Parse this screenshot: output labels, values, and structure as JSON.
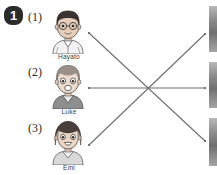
{
  "worksheet": {
    "question_number": "1",
    "items": [
      {
        "number": "(1)",
        "name": "Hayato",
        "portrait": "boy-with-glasses-portrait",
        "hair_color": "#3a3330",
        "skin_color": "#e7cdb8"
      },
      {
        "number": "(2)",
        "name": "Luke",
        "portrait": "boy-light-hair-portrait",
        "hair_color": "#9b9088",
        "skin_color": "#eddacb"
      },
      {
        "number": "(3)",
        "name": "Emi",
        "portrait": "girl-bob-hair-portrait",
        "hair_color": "#4a403b",
        "skin_color": "#ecd5c2"
      }
    ],
    "connector_lines": [
      {
        "name": "line-from-item-1",
        "x1": 89,
        "y1": 33,
        "x2": 205,
        "y2": 141
      },
      {
        "name": "line-from-item-2",
        "x1": 89,
        "y1": 88,
        "x2": 205,
        "y2": 88
      },
      {
        "name": "line-from-item-3",
        "x1": 89,
        "y1": 145,
        "x2": 205,
        "y2": 34
      }
    ],
    "line_color": "#6e6e6e",
    "answer_thumbnails": [
      {
        "name": "answer-thumbnail-top",
        "top": 6,
        "height": 46
      },
      {
        "name": "answer-thumbnail-middle",
        "top": 62,
        "height": 46
      },
      {
        "name": "answer-thumbnail-bottom",
        "top": 118,
        "height": 48
      }
    ]
  }
}
